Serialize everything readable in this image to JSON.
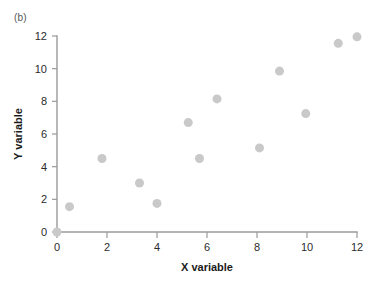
{
  "figure": {
    "panel_label": "(b)",
    "background_color": "#ffffff"
  },
  "chart_data": {
    "type": "scatter",
    "title": "",
    "subtitle": "",
    "panel_label": "(b)",
    "xlabel": "X variable",
    "ylabel": "Y variable",
    "xlim": [
      0,
      12
    ],
    "ylim": [
      0,
      12
    ],
    "xticks": [
      0,
      2,
      4,
      6,
      8,
      10,
      12
    ],
    "yticks": [
      0,
      2,
      4,
      6,
      8,
      10,
      12
    ],
    "xtick_labels": [
      "0",
      "2",
      "4",
      "6",
      "8",
      "10",
      "12"
    ],
    "ytick_labels": [
      "0",
      "2",
      "4",
      "6",
      "8",
      "10",
      "12"
    ],
    "grid": false,
    "legend": null,
    "legend_position": "none",
    "marker": {
      "shape": "circle",
      "color": "#c9c9c9",
      "size_px": 9
    },
    "series": [
      {
        "name": "observations",
        "color": "#c9c9c9",
        "points": [
          {
            "x": 0.0,
            "y": 0.0
          },
          {
            "x": 0.5,
            "y": 1.55
          },
          {
            "x": 1.8,
            "y": 4.5
          },
          {
            "x": 3.3,
            "y": 3.0
          },
          {
            "x": 4.0,
            "y": 1.75
          },
          {
            "x": 5.25,
            "y": 6.7
          },
          {
            "x": 5.7,
            "y": 4.5
          },
          {
            "x": 6.4,
            "y": 8.15
          },
          {
            "x": 8.1,
            "y": 5.15
          },
          {
            "x": 8.9,
            "y": 9.85
          },
          {
            "x": 9.95,
            "y": 7.25
          },
          {
            "x": 11.25,
            "y": 11.55
          },
          {
            "x": 12.0,
            "y": 11.95
          }
        ]
      }
    ],
    "x": [
      0.0,
      0.5,
      1.8,
      3.3,
      4.0,
      5.25,
      5.7,
      6.4,
      8.1,
      8.9,
      9.95,
      11.25,
      12.0
    ],
    "y": [
      0.0,
      1.55,
      4.5,
      3.0,
      1.75,
      6.7,
      4.5,
      8.15,
      5.15,
      9.85,
      7.25,
      11.55,
      11.95
    ]
  },
  "axes_style": {
    "axis_color": "#9a9a9a",
    "tick_label_color": "#2b2b2b",
    "axis_title_color": "#1a1a1a"
  }
}
